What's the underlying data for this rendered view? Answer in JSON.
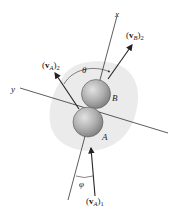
{
  "diagram": {
    "type": "collision-of-two-spheres",
    "axes": {
      "x_label": "x",
      "y_label": "y"
    },
    "bodies": [
      {
        "name": "A",
        "label": "A"
      },
      {
        "name": "B",
        "label": "B"
      }
    ],
    "vectors": {
      "vA2": {
        "bold": "v",
        "sub": "A",
        "post": "2"
      },
      "vB2": {
        "bold": "v",
        "sub": "B",
        "post": "2"
      },
      "vA1": {
        "bold": "v",
        "sub": "A",
        "post": "1"
      }
    },
    "angles": {
      "theta": "θ",
      "phi": "φ"
    },
    "colors": {
      "sphere": "#a9a9a9",
      "sphere_highlight": "#d9d9d9",
      "blob": "#e9e9e9",
      "line": "#333333"
    }
  }
}
